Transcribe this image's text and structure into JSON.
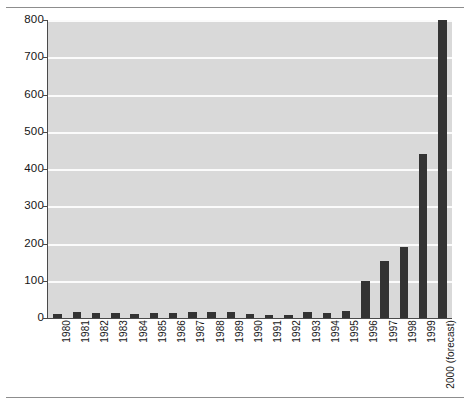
{
  "chart_data": {
    "type": "bar",
    "title": "",
    "subtitle": "",
    "xlabel": "",
    "ylabel": "",
    "categories": [
      "1980",
      "1981",
      "1982",
      "1983",
      "1984",
      "1985",
      "1986",
      "1987",
      "1988",
      "1989",
      "1990",
      "1991",
      "1992",
      "1993",
      "1994",
      "1995",
      "1996",
      "1997",
      "1998",
      "1999",
      "2000 (forecast)"
    ],
    "values": [
      10,
      16,
      14,
      14,
      12,
      13,
      13,
      15,
      15,
      15,
      10,
      8,
      9,
      17,
      14,
      18,
      100,
      152,
      190,
      440,
      800
    ],
    "ylim": [
      0,
      800
    ],
    "yticks": [
      0,
      100,
      200,
      300,
      400,
      500,
      600,
      700,
      800
    ],
    "ytick_labels": [
      "0",
      "100",
      "200",
      "300",
      "400",
      "500",
      "600",
      "700",
      "800"
    ],
    "grid": true,
    "grid_axis": "y",
    "legend": false,
    "legend_position": "none",
    "bar_color": "#333333",
    "plot_background": "#d9d9d9",
    "gridline_color": "#fbfbfb",
    "axis_color": "#4a4a4a"
  },
  "decorations": {
    "top_rule": "",
    "bottom_rule": ""
  }
}
